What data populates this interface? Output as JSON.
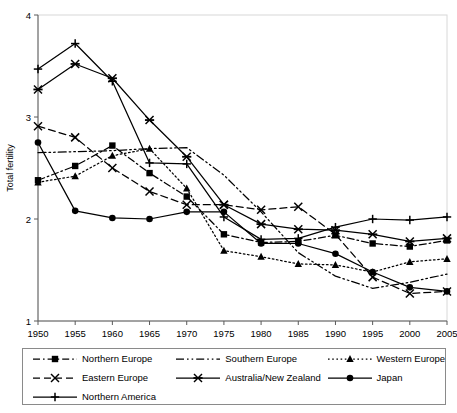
{
  "chart_data": {
    "type": "line",
    "title": "",
    "xlabel": "",
    "ylabel": "Total fertility",
    "xlim": [
      1950,
      2005
    ],
    "ylim": [
      1,
      4
    ],
    "yticks": [
      1,
      2,
      3,
      4
    ],
    "grid": false,
    "legend_position": "bottom",
    "categories": [
      1950,
      1955,
      1960,
      1965,
      1970,
      1975,
      1980,
      1985,
      1990,
      1995,
      2000,
      2005
    ],
    "xticklabels": [
      "1950",
      "1955",
      "1960",
      "1965",
      "1970",
      "1975",
      "1980",
      "1985",
      "1990",
      "1995",
      "2000",
      "2005"
    ],
    "yticklabels": [
      "1",
      "2",
      "3",
      "4"
    ],
    "series": [
      {
        "name": "Northern Europe",
        "marker": "square",
        "dash": "dash-dot",
        "values": [
          2.38,
          2.52,
          2.72,
          2.45,
          2.22,
          1.85,
          1.77,
          1.78,
          1.84,
          1.76,
          1.73,
          1.79
        ]
      },
      {
        "name": "Southern Europe",
        "marker": "none",
        "dash": "dash-dot-dot",
        "values": [
          2.65,
          2.66,
          2.67,
          2.69,
          2.7,
          2.43,
          2.07,
          1.67,
          1.44,
          1.32,
          1.38,
          1.46
        ]
      },
      {
        "name": "Western Europe",
        "marker": "triangle",
        "dash": "dotted",
        "values": [
          2.36,
          2.42,
          2.62,
          2.69,
          2.3,
          1.69,
          1.63,
          1.56,
          1.55,
          1.48,
          1.58,
          1.61
        ]
      },
      {
        "name": "Eastern Europe",
        "marker": "x",
        "dash": "dashed",
        "values": [
          2.91,
          2.8,
          2.5,
          2.27,
          2.14,
          2.14,
          2.09,
          2.12,
          1.85,
          1.43,
          1.27,
          1.29
        ]
      },
      {
        "name": "Australia/New Zealand",
        "marker": "star",
        "dash": "solid",
        "values": [
          3.27,
          3.52,
          3.38,
          2.97,
          2.61,
          2.14,
          1.95,
          1.9,
          1.89,
          1.85,
          1.78,
          1.81
        ]
      },
      {
        "name": "Japan",
        "marker": "circle",
        "dash": "solid",
        "values": [
          2.75,
          2.08,
          2.01,
          2.0,
          2.07,
          2.07,
          1.76,
          1.76,
          1.66,
          1.48,
          1.33,
          1.29
        ]
      },
      {
        "name": "Northern America",
        "marker": "plus",
        "dash": "solid",
        "values": [
          3.47,
          3.72,
          3.35,
          2.55,
          2.54,
          2.02,
          1.8,
          1.81,
          1.92,
          2.0,
          1.99,
          2.02
        ]
      }
    ]
  },
  "axis": {
    "ylabel": "Total fertility"
  },
  "legend": {
    "items": [
      {
        "label": "Northern Europe",
        "marker": "square",
        "dash": "dash-dot"
      },
      {
        "label": "Southern Europe",
        "marker": "none",
        "dash": "dash-dot-dot"
      },
      {
        "label": "Western Europe",
        "marker": "triangle",
        "dash": "dotted"
      },
      {
        "label": "Eastern Europe",
        "marker": "x",
        "dash": "dashed"
      },
      {
        "label": "Australia/New Zealand",
        "marker": "star",
        "dash": "solid"
      },
      {
        "label": "Japan",
        "marker": "circle",
        "dash": "solid"
      },
      {
        "label": "Northern America",
        "marker": "plus",
        "dash": "solid"
      }
    ]
  }
}
